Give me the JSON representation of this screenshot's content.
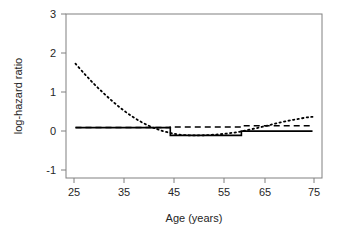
{
  "figure": {
    "background": "#ffffff",
    "plot_area": {
      "left": 66,
      "top": 14,
      "right": 322,
      "bottom": 178
    }
  },
  "chart_data": {
    "type": "line",
    "title": "",
    "xlabel": "Age (years)",
    "ylabel": "log-hazard ratio",
    "xlim": [
      23,
      77
    ],
    "ylim": [
      -1.42,
      3.2
    ],
    "xticks": [
      25,
      35,
      45,
      55,
      65,
      75
    ],
    "xtick_labels": [
      "25",
      "35",
      "45",
      "55",
      "65",
      "75"
    ],
    "yticks": [
      -1,
      0,
      1,
      2,
      3
    ],
    "ytick_labels": [
      "-1",
      "0",
      "1",
      "2",
      "3"
    ],
    "grid": false,
    "legend": "none",
    "series": [
      {
        "name": "step-solid",
        "style": "solid",
        "color": "#000000",
        "shape": "step",
        "x": [
          25,
          45,
          45,
          60,
          60,
          75
        ],
        "values": [
          0.0,
          0.0,
          -0.22,
          -0.22,
          -0.1,
          -0.1
        ]
      },
      {
        "name": "dashed",
        "style": "dashed",
        "color": "#000000",
        "shape": "step",
        "x": [
          25,
          45,
          45,
          60,
          60,
          75
        ],
        "values": [
          0.0,
          0.0,
          0.02,
          0.02,
          0.05,
          0.05
        ]
      },
      {
        "name": "dotted-smooth",
        "style": "dotted",
        "color": "#000000",
        "shape": "smooth",
        "x": [
          25,
          27,
          29,
          31,
          33,
          35,
          37,
          39,
          41,
          43,
          45,
          47,
          50,
          53,
          56,
          59,
          62,
          65,
          68,
          71,
          74,
          75
        ],
        "values": [
          1.8,
          1.5,
          1.22,
          0.96,
          0.72,
          0.5,
          0.31,
          0.15,
          0.02,
          -0.08,
          -0.15,
          -0.2,
          -0.22,
          -0.21,
          -0.18,
          -0.13,
          -0.05,
          0.04,
          0.14,
          0.22,
          0.29,
          0.3
        ]
      }
    ]
  }
}
